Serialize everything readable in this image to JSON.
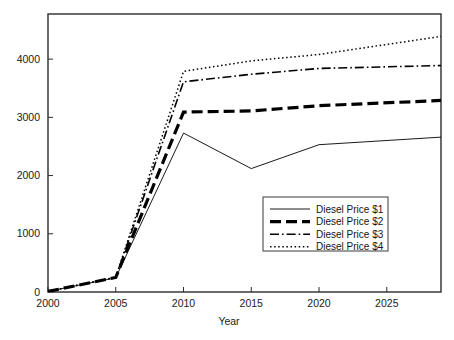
{
  "chart_data": {
    "type": "line",
    "title": "",
    "xlabel": "Year",
    "ylabel": "",
    "grid": false,
    "legend_position": "center-right-inside",
    "xlim": [
      2000,
      2029
    ],
    "ylim": [
      0,
      4775
    ],
    "x_ticks": [
      2000,
      2005,
      2010,
      2015,
      2020,
      2025
    ],
    "x_tick_labels": [
      "2000",
      "2005",
      "2010",
      "2015",
      "2020",
      "2025"
    ],
    "y_ticks": [
      0,
      1000,
      2000,
      3000,
      4000
    ],
    "y_tick_labels": [
      "0",
      "1000",
      "2000",
      "3000",
      "4000"
    ],
    "x": [
      2000,
      2005,
      2010,
      2015,
      2020,
      2029
    ],
    "series": [
      {
        "name": "Diesel Price $1",
        "style": "solid",
        "width": 0.9,
        "color": "#000000",
        "values": [
          10,
          245,
          2730,
          2120,
          2530,
          2660
        ]
      },
      {
        "name": "Diesel Price $2",
        "style": "dashed",
        "width": 3.2,
        "color": "#000000",
        "values": [
          10,
          250,
          3090,
          3110,
          3200,
          3290
        ]
      },
      {
        "name": "Diesel Price $3",
        "style": "dashdot",
        "width": 1.6,
        "color": "#000000",
        "values": [
          10,
          250,
          3610,
          3740,
          3840,
          3890
        ]
      },
      {
        "name": "Diesel Price $4",
        "style": "dotted",
        "width": 1.5,
        "color": "#000000",
        "values": [
          10,
          255,
          3790,
          3970,
          4080,
          4390
        ]
      }
    ]
  },
  "legend": {
    "entries": [
      {
        "label": "Diesel Price $1"
      },
      {
        "label": "Diesel Price $2"
      },
      {
        "label": "Diesel Price $3"
      },
      {
        "label": "Diesel Price $4"
      }
    ]
  },
  "axes": {
    "x_title": "Year"
  },
  "colors": {
    "background": "#ffffff",
    "frame": "#2b2b2b",
    "series": "#000000",
    "text": "#1a1a1a"
  }
}
